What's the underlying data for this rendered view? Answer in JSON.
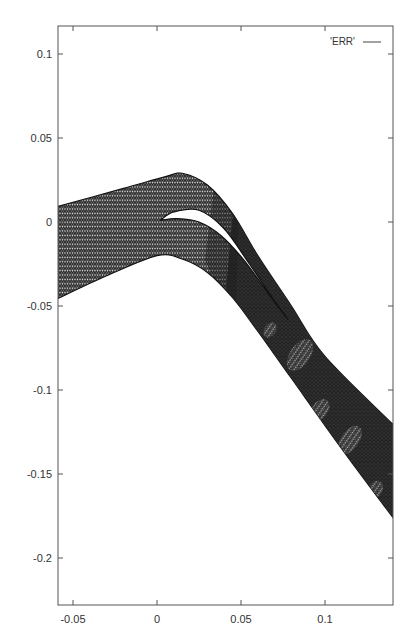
{
  "chart_data": {
    "type": "mesh",
    "title": "",
    "xlabel": "",
    "ylabel": "",
    "xlim": [
      -0.06,
      0.142
    ],
    "ylim": [
      -0.23,
      0.117
    ],
    "grid": false,
    "legend_position": "top-right",
    "legend": [
      {
        "label": "'ERR'",
        "style": "line"
      }
    ],
    "x_ticks": [
      {
        "value": -0.05,
        "label": "-0.05"
      },
      {
        "value": 0,
        "label": "0"
      },
      {
        "value": 0.05,
        "label": "0.05"
      },
      {
        "value": 0.1,
        "label": "0.1"
      }
    ],
    "y_ticks": [
      {
        "value": 0.1,
        "label": "0.1"
      },
      {
        "value": 0.05,
        "label": "0.05"
      },
      {
        "value": 0,
        "label": "0"
      },
      {
        "value": -0.05,
        "label": "-0.05"
      },
      {
        "value": -0.1,
        "label": "-0.1"
      },
      {
        "value": -0.15,
        "label": "-0.15"
      },
      {
        "value": -0.2,
        "label": "-0.2"
      }
    ],
    "series": [
      {
        "name": "'ERR'",
        "description": "Triangular mesh of a bent channel with a slotted airfoil-like gap; refined (dark) region downstream",
        "outer_upper_boundary": [
          [
            -0.06,
            0.009
          ],
          [
            -0.02,
            0.02
          ],
          [
            0.005,
            0.027
          ],
          [
            0.015,
            0.029
          ],
          [
            0.03,
            0.022
          ],
          [
            0.045,
            0.005
          ],
          [
            0.06,
            -0.02
          ],
          [
            0.08,
            -0.05
          ],
          [
            0.1,
            -0.08
          ],
          [
            0.142,
            -0.122
          ]
        ],
        "outer_lower_boundary": [
          [
            0.142,
            -0.178
          ],
          [
            0.11,
            -0.135
          ],
          [
            0.08,
            -0.093
          ],
          [
            0.06,
            -0.065
          ],
          [
            0.045,
            -0.045
          ],
          [
            0.03,
            -0.03
          ],
          [
            0.015,
            -0.022
          ],
          [
            0.0,
            -0.02
          ],
          [
            -0.03,
            -0.032
          ],
          [
            -0.06,
            -0.046
          ]
        ],
        "slot_upper": [
          [
            0.002,
            0.001
          ],
          [
            0.01,
            0.006
          ],
          [
            0.025,
            0.007
          ],
          [
            0.04,
            -0.004
          ],
          [
            0.055,
            -0.025
          ],
          [
            0.07,
            -0.047
          ],
          [
            0.078,
            -0.058
          ]
        ],
        "slot_lower": [
          [
            0.078,
            -0.058
          ],
          [
            0.068,
            -0.045
          ],
          [
            0.052,
            -0.023
          ],
          [
            0.038,
            -0.008
          ],
          [
            0.025,
            0.0
          ],
          [
            0.012,
            0.002
          ],
          [
            0.002,
            0.001
          ]
        ]
      }
    ]
  },
  "plot": {
    "colors": {
      "frame": "#555555",
      "mesh_light": "#7a7a7a",
      "mesh_dark": "#1c1c1c",
      "background": "#ffffff"
    }
  }
}
